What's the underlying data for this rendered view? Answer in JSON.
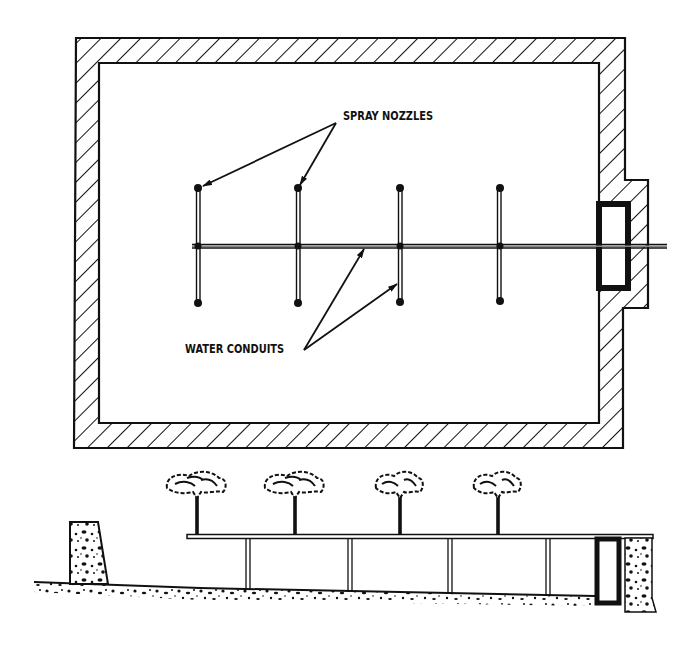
{
  "diagram": {
    "plan_view": {
      "labels": {
        "spray_nozzles": "SPRAY NOZZLES",
        "water_conduits": "WATER CONDUITS"
      },
      "conduit_x_positions": [
        198,
        298,
        400,
        499
      ],
      "nozzle_count": 8,
      "branch_count": 4
    },
    "section_view": {
      "tree_count": 4,
      "support_count": 4
    },
    "colors": {
      "ink": "#111111",
      "background": "#ffffff"
    }
  }
}
